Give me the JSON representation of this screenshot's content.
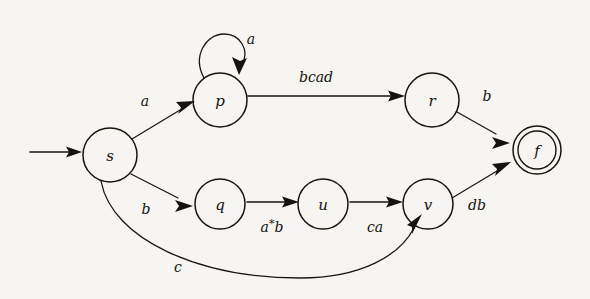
{
  "diagram": {
    "kind": "finite-automaton",
    "title": "",
    "background_color": "#f6f5f1",
    "ink_color": "#15130f",
    "states": [
      {
        "id": "s",
        "label": "s",
        "cx": 110,
        "cy": 155,
        "r": 27,
        "accepting": false,
        "start": true
      },
      {
        "id": "p",
        "label": "p",
        "cx": 220,
        "cy": 100,
        "r": 27,
        "accepting": false,
        "start": false
      },
      {
        "id": "q",
        "label": "q",
        "cx": 220,
        "cy": 205,
        "r": 25,
        "accepting": false,
        "start": false
      },
      {
        "id": "u",
        "label": "u",
        "cx": 323,
        "cy": 205,
        "r": 25,
        "accepting": false,
        "start": false
      },
      {
        "id": "r",
        "label": "r",
        "cx": 432,
        "cy": 100,
        "r": 27,
        "accepting": false,
        "start": false
      },
      {
        "id": "v",
        "label": "v",
        "cx": 428,
        "cy": 205,
        "r": 25,
        "accepting": false,
        "start": false
      },
      {
        "id": "f",
        "label": "f",
        "cx": 537,
        "cy": 150,
        "r": 24,
        "accepting": true,
        "start": false
      }
    ],
    "transitions": [
      {
        "from": "start",
        "to": "s",
        "label": ""
      },
      {
        "from": "s",
        "to": "p",
        "label": "a"
      },
      {
        "from": "p",
        "to": "p",
        "label": "a",
        "self_loop": true
      },
      {
        "from": "p",
        "to": "r",
        "label": "bcad"
      },
      {
        "from": "r",
        "to": "f",
        "label": "b"
      },
      {
        "from": "s",
        "to": "q",
        "label": "b"
      },
      {
        "from": "q",
        "to": "u",
        "label": "a*b",
        "label_base": "a",
        "label_star": "*",
        "label_tail": "b"
      },
      {
        "from": "u",
        "to": "v",
        "label": "ca"
      },
      {
        "from": "v",
        "to": "f",
        "label": "db"
      },
      {
        "from": "s",
        "to": "v",
        "label": "c",
        "curved": true
      }
    ],
    "labels": {
      "state_s": "s",
      "state_p": "p",
      "state_q": "q",
      "state_u": "u",
      "state_r": "r",
      "state_v": "v",
      "state_f": "f",
      "edge_s_p": "a",
      "edge_p_self": "a",
      "edge_p_r": "bcad",
      "edge_r_f": "b",
      "edge_s_q": "b",
      "edge_q_u_base": "a",
      "edge_q_u_star": "*",
      "edge_q_u_tail": "b",
      "edge_u_v": "ca",
      "edge_v_f": "db",
      "edge_s_v": "c"
    }
  }
}
